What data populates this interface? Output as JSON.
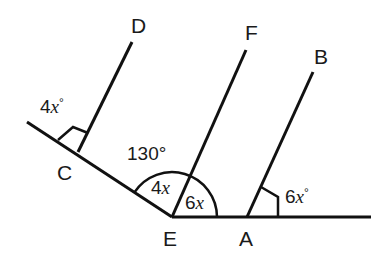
{
  "diagram": {
    "type": "geometry",
    "points": {
      "D": "D",
      "F": "F",
      "B": "B",
      "C": "C",
      "E": "E",
      "A": "A"
    },
    "angles": {
      "at_C_coef": "4",
      "at_C_var": "x",
      "at_C_deg": "°",
      "big_at_E": "130°",
      "inner_left_coef": "4",
      "inner_left_var": "x",
      "inner_right_coef": "6",
      "inner_right_var": "x",
      "at_A_coef": "6",
      "at_A_var": "x",
      "at_A_deg": "°"
    },
    "colors": {
      "stroke": "#111111",
      "background": "#ffffff"
    }
  }
}
